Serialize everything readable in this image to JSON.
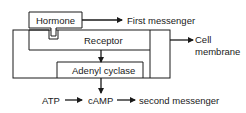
{
  "diagram": {
    "hormone_label": "Hormone",
    "first_messenger_label": "First messenger",
    "receptor_label": "Receptor",
    "cell_label": "Cell",
    "membrane_label": "membrane",
    "adenyl_cyclase_label": "Adenyl cyclase",
    "atp_label": "ATP",
    "camp_label": "cAMP",
    "second_messenger_label": "second messenger",
    "colors": {
      "stroke": "#1a1a1a",
      "background": "#ffffff"
    }
  }
}
